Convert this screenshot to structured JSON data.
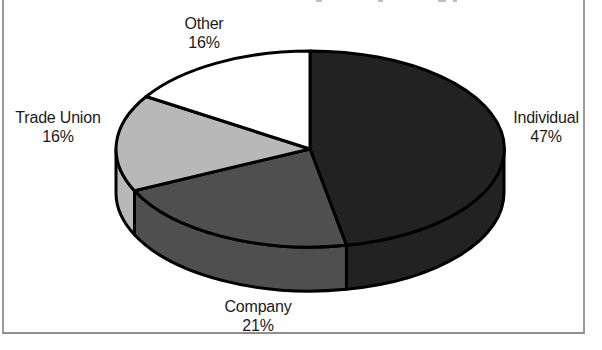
{
  "chart_data": {
    "type": "pie",
    "style": "3d-exploded-none",
    "start_angle_deg": 0,
    "direction": "clockwise",
    "legend": "none",
    "labels_shown": "name-and-percent",
    "slices": [
      {
        "label": "Individual",
        "value": 47,
        "display_pct": "47%",
        "color": "#222222"
      },
      {
        "label": "Company",
        "value": 21,
        "display_pct": "21%",
        "color": "#4f4f4f"
      },
      {
        "label": "Trade Union",
        "value": 16,
        "display_pct": "16%",
        "color": "#b8b8b8"
      },
      {
        "label": "Other",
        "value": 16,
        "display_pct": "16%",
        "color": "#ffffff"
      }
    ],
    "outline_color": "#000000",
    "label_text_color": "#1a1a1a"
  },
  "frame": {
    "border_color": "#9a9a9a"
  }
}
